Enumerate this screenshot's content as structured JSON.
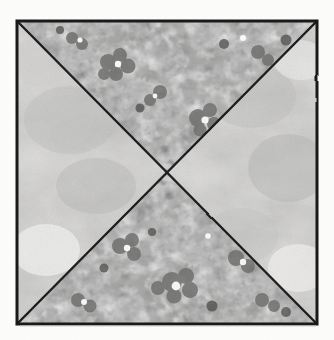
{
  "figure": {
    "kind": "quilt-block-illustration",
    "medium": "pen and ink with watercolor wash",
    "canvas": {
      "width": 334,
      "height": 340
    },
    "background_color": "#fdfdfc",
    "clipped_caption_fragment": "g"
  },
  "block": {
    "shape": "square",
    "outline_color": "#1a1a1a",
    "outline_width_px": 3,
    "corners": {
      "top_left": {
        "x": 17,
        "y": 21
      },
      "top_right": {
        "x": 317,
        "y": 21
      },
      "bottom_right": {
        "x": 317,
        "y": 324
      },
      "bottom_left": {
        "x": 17,
        "y": 324
      }
    },
    "center": {
      "x": 167,
      "y": 173
    },
    "diagonal_color": "#1a1a1a",
    "diagonal_width_px": 2.4,
    "division": "two full diagonals forming four triangles"
  },
  "patches": [
    {
      "position": "top",
      "name": "top-triangle",
      "fabric": "dark floral print",
      "base_color": "#9a9a98",
      "motif_dark_color": "#6a6a68",
      "motif_darkest_color": "#4e4e4c",
      "motif_light_color": "#fbfbf9"
    },
    {
      "position": "right",
      "name": "right-triangle",
      "fabric": "light mottled wash",
      "base_color": "#dedddb",
      "shade_color": "#bcbcba",
      "highlight_color": "#f4f3f1"
    },
    {
      "position": "bottom",
      "name": "bottom-triangle",
      "fabric": "dark floral print",
      "base_color": "#9a9a98",
      "motif_dark_color": "#6a6a68",
      "motif_darkest_color": "#4e4e4c",
      "motif_light_color": "#fbfbf9"
    },
    {
      "position": "left",
      "name": "left-triangle",
      "fabric": "light mottled wash",
      "base_color": "#dedddb",
      "shade_color": "#bcbcba",
      "highlight_color": "#f4f3f1"
    }
  ]
}
